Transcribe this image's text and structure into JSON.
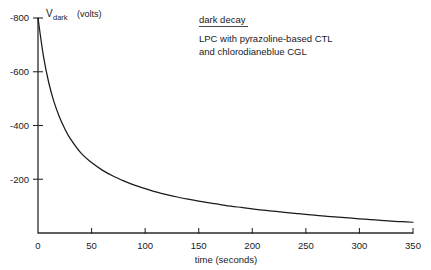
{
  "chart_data": {
    "type": "line",
    "title": "",
    "xlabel": "time (seconds)",
    "ylabel": "V_dark  (volts)",
    "ylabel_main": "V",
    "ylabel_sub": "dark",
    "ylabel_units": "(volts)",
    "xlim": [
      0,
      350
    ],
    "ylim": [
      -800,
      0
    ],
    "grid": false,
    "legend": "none",
    "xticks": [
      0,
      50,
      100,
      150,
      200,
      250,
      300,
      350
    ],
    "xtick_labels": [
      "0",
      "50",
      "100",
      "150",
      "200",
      "250",
      "300",
      "350"
    ],
    "yticks": [
      -800,
      -600,
      -400,
      -200
    ],
    "ytick_labels": [
      "-800",
      "-600",
      "-400",
      "-200"
    ],
    "series": [
      {
        "name": "dark decay",
        "x": [
          0,
          5,
          10,
          15,
          20,
          25,
          30,
          40,
          50,
          60,
          70,
          80,
          90,
          100,
          110,
          120,
          130,
          140,
          150,
          160,
          170,
          180,
          190,
          200,
          210,
          220,
          230,
          240,
          250,
          260,
          270,
          280,
          290,
          300,
          310,
          320,
          330,
          340,
          350
        ],
        "y": [
          -800,
          -660,
          -560,
          -487,
          -432,
          -388,
          -352,
          -298,
          -262,
          -234,
          -212,
          -194,
          -178,
          -165,
          -153,
          -143,
          -134,
          -126,
          -119,
          -112,
          -106,
          -100,
          -95,
          -90,
          -85,
          -81,
          -77,
          -73,
          -69,
          -66,
          -62,
          -59,
          -56,
          -53,
          -50,
          -47,
          -44,
          -42,
          -40
        ]
      }
    ],
    "annotations": {
      "heading": "dark decay",
      "line1": "LPC with pyrazoline-based CTL",
      "line2": "and chlorodianeblue CGL"
    }
  }
}
